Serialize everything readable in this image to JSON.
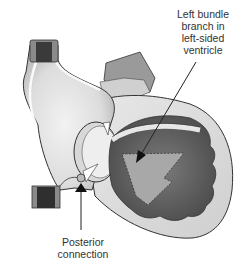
{
  "figure": {
    "labels": {
      "left_bundle_branch": [
        "Left bundle",
        "branch in",
        "left-sided",
        "ventricle"
      ],
      "posterior_connection": [
        "Posterior",
        "connection"
      ]
    },
    "colors": {
      "background": "#ffffff",
      "light_tissue": "#e6e6e6",
      "mid_tissue": "#bdbdbd",
      "dark_tissue": "#6e6e6e",
      "darker_tissue": "#555555",
      "vessel_lumen": "#3a3a3a",
      "outline": "#333333",
      "text": "#333333"
    }
  }
}
